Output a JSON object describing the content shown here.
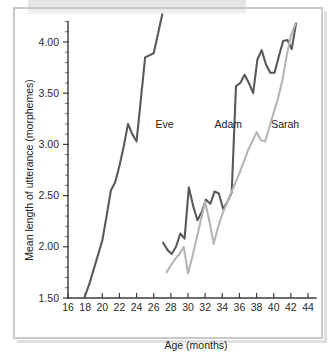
{
  "figure": {
    "background_color": "#ffffff",
    "frame_color": "#c9c9c9"
  },
  "chart_data": {
    "type": "line",
    "title": "",
    "xlabel": "Age (months)",
    "ylabel": "Mean length of utterance (morphemes)",
    "xlim": [
      16,
      44
    ],
    "ylim": [
      1.5,
      4.3
    ],
    "xticks": [
      16,
      18,
      20,
      22,
      24,
      26,
      28,
      30,
      32,
      34,
      36,
      38,
      40,
      42,
      44
    ],
    "xticklabels": [
      "16",
      "18",
      "20",
      "22",
      "24",
      "26",
      "28",
      "30",
      "32",
      "34",
      "36",
      "38",
      "40",
      "42",
      "44"
    ],
    "yticks": [
      1.5,
      2.0,
      2.5,
      3.0,
      3.5,
      4.0
    ],
    "yticklabels": [
      "1.50",
      "2.00",
      "2.50",
      "3.00",
      "3.50",
      "4.00"
    ],
    "y_minor_tick_step": 0.1,
    "grid": false,
    "legend": "inline-labels",
    "series": [
      {
        "name": "Eve",
        "color": "#595959",
        "label_x": 26.2,
        "label_y": 3.16,
        "x": [
          17.9,
          18.5,
          19.0,
          19.5,
          20.0,
          20.5,
          21.0,
          21.5,
          22.0,
          22.5,
          23.0,
          23.5,
          24.0,
          24.5,
          25.0,
          26.0,
          27.0
        ],
        "y": [
          1.5,
          1.64,
          1.78,
          1.92,
          2.06,
          2.3,
          2.55,
          2.63,
          2.79,
          2.98,
          3.2,
          3.1,
          3.03,
          3.44,
          3.85,
          3.89,
          4.27
        ]
      },
      {
        "name": "Adam",
        "color": "#595959",
        "label_x": 33.1,
        "label_y": 3.16,
        "x": [
          27.1,
          27.6,
          28.1,
          28.6,
          29.1,
          29.6,
          30.1,
          30.6,
          31.1,
          31.6,
          32.1,
          32.6,
          33.1,
          33.6,
          34.1,
          34.6,
          35.1,
          35.6,
          36.1,
          36.6,
          37.1,
          37.6,
          38.1,
          38.6,
          39.1,
          39.6,
          40.1,
          40.6,
          41.1,
          41.6,
          42.1,
          42.6
        ],
        "y": [
          2.04,
          1.97,
          1.93,
          2.0,
          2.13,
          2.08,
          2.58,
          2.4,
          2.26,
          2.34,
          2.46,
          2.42,
          2.54,
          2.52,
          2.37,
          2.44,
          2.53,
          3.57,
          3.6,
          3.68,
          3.6,
          3.5,
          3.83,
          3.92,
          3.78,
          3.7,
          3.7,
          3.86,
          4.01,
          4.02,
          3.93,
          4.18
        ]
      },
      {
        "name": "Sarah",
        "color": "#b5b5b5",
        "label_x": 39.7,
        "label_y": 3.16,
        "x": [
          27.5,
          28.0,
          28.5,
          29.0,
          29.5,
          30.0,
          30.5,
          31.0,
          31.5,
          32.0,
          32.5,
          33.0,
          33.5,
          34.0,
          34.5,
          35.0,
          35.5,
          36.0,
          36.5,
          37.0,
          37.5,
          38.0,
          38.5,
          39.0,
          39.5,
          40.0,
          40.5,
          41.0,
          41.5,
          42.0,
          42.5
        ],
        "y": [
          1.75,
          1.82,
          1.88,
          1.93,
          2.0,
          1.74,
          1.9,
          2.08,
          2.26,
          2.44,
          2.25,
          2.03,
          2.19,
          2.32,
          2.42,
          2.52,
          2.62,
          2.72,
          2.83,
          2.94,
          3.03,
          3.12,
          3.04,
          3.03,
          3.17,
          3.31,
          3.45,
          3.62,
          3.86,
          4.06,
          4.17
        ]
      }
    ]
  }
}
